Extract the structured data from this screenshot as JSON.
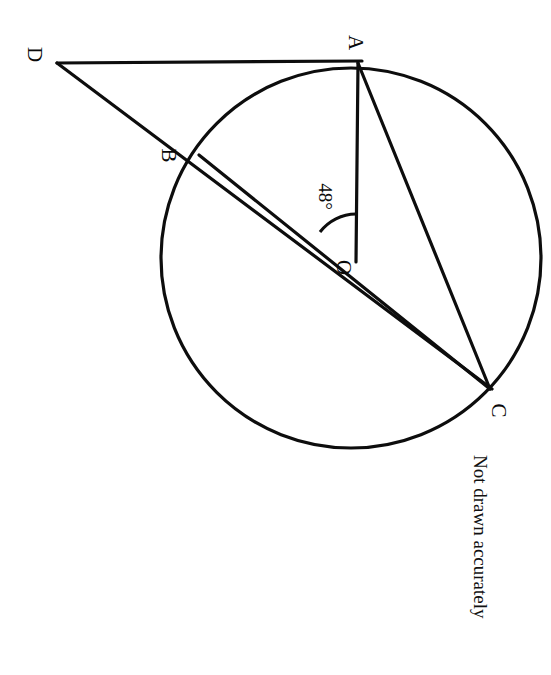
{
  "figure": {
    "type": "circle-geometry-diagram",
    "caption": "Not drawn accurately",
    "stroke_color": "#0d0d0d",
    "background_color": "#ffffff"
  },
  "labels": {
    "A": "A",
    "B": "B",
    "C": "C",
    "D": "D",
    "O": "O",
    "angle": "48°"
  },
  "geometry": {
    "circle": {
      "cx": 351,
      "cy": 258,
      "r": 190,
      "stroke_width": 3.2
    },
    "points": {
      "A": {
        "x": 358,
        "y": 63,
        "on_circle": true
      },
      "B": {
        "x": 200,
        "y": 152,
        "on_circle": true
      },
      "C": {
        "x": 490,
        "y": 389,
        "on_circle": true
      },
      "D": {
        "x": 57,
        "y": 63,
        "on_circle": false
      },
      "O": {
        "x": 351,
        "y": 258,
        "on_circle": false
      }
    },
    "segments": [
      {
        "name": "DA",
        "from": "D",
        "to": "A"
      },
      {
        "name": "DC",
        "from": "D",
        "to": "C"
      },
      {
        "name": "AO",
        "from": "A",
        "to": "O"
      },
      {
        "name": "AC",
        "from": "A",
        "to": "C"
      },
      {
        "name": "BC",
        "from": "B",
        "to": "C"
      }
    ],
    "angle_arc": {
      "vertex": "O",
      "value": 48,
      "unit": "degrees",
      "radius": 46,
      "between": [
        "OA",
        "OB"
      ]
    }
  },
  "rotation": {
    "text_rotation_deg": 90,
    "description": "All text labels appear rotated 90 degrees clockwise"
  }
}
